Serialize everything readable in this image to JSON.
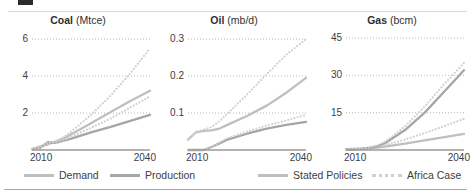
{
  "figure": {
    "legend": [
      {
        "key": "demand",
        "label": "Demand",
        "style": "solid",
        "color": "#bfbfbf"
      },
      {
        "key": "production",
        "label": "Production",
        "style": "solid",
        "color": "#a6a6a6"
      },
      {
        "key": "stated_policies",
        "label": "Stated Policies",
        "style": "solid",
        "color": "#bfbfbf"
      },
      {
        "key": "africa_case",
        "label": "Africa Case",
        "style": "dotted",
        "color": "#cfcfcf"
      }
    ]
  },
  "chart_data": [
    {
      "type": "line",
      "title": "Coal (Mtce)",
      "title_name": "Coal",
      "title_unit": "(Mtce)",
      "xlabel": "",
      "ylabel": "",
      "xlim": [
        2010,
        2040
      ],
      "ylim": [
        0,
        6.6
      ],
      "xticks": [
        2010,
        2040
      ],
      "xticklabels": [
        "2010",
        "2040"
      ],
      "yticks": [
        2,
        4,
        6
      ],
      "yticklabels": [
        "2",
        "4",
        "6"
      ],
      "grid": "horizontal-dotted",
      "x": [
        2010,
        2012,
        2014,
        2016,
        2018,
        2020,
        2025,
        2030,
        2035,
        2040
      ],
      "series": [
        {
          "name": "Demand Stated Policies",
          "style": "solid",
          "color": "#bfbfbf",
          "values": [
            0.05,
            0.18,
            0.3,
            0.45,
            0.62,
            0.85,
            1.45,
            2.05,
            2.65,
            3.2
          ]
        },
        {
          "name": "Demand Africa Case",
          "style": "dotted",
          "color": "#cfcfcf",
          "values": [
            0.05,
            0.18,
            0.3,
            0.48,
            0.7,
            1.0,
            1.9,
            2.95,
            4.15,
            5.5
          ]
        },
        {
          "name": "Production Stated Policies",
          "style": "solid",
          "color": "#a6a6a6",
          "values": [
            0.05,
            0.1,
            0.42,
            0.38,
            0.5,
            0.62,
            0.95,
            1.25,
            1.58,
            1.9
          ]
        },
        {
          "name": "Production Africa Case",
          "style": "dotted",
          "color": "#cfcfcf",
          "values": [
            0.05,
            0.1,
            0.42,
            0.4,
            0.55,
            0.72,
            1.2,
            1.7,
            2.3,
            2.9
          ]
        }
      ]
    },
    {
      "type": "line",
      "title": "Oil (mb/d)",
      "title_name": "Oil",
      "title_unit": "(mb/d)",
      "xlabel": "",
      "ylabel": "",
      "xlim": [
        2010,
        2040
      ],
      "ylim": [
        0,
        0.33
      ],
      "xticks": [
        2010,
        2040
      ],
      "xticklabels": [
        "2010",
        "2040"
      ],
      "yticks": [
        0.1,
        0.2,
        0.3
      ],
      "yticklabels": [
        "0.1",
        "0.2",
        "0.3"
      ],
      "grid": "horizontal-dotted",
      "x": [
        2010,
        2012,
        2014,
        2016,
        2018,
        2020,
        2025,
        2030,
        2035,
        2040
      ],
      "series": [
        {
          "name": "Demand Stated Policies",
          "style": "solid",
          "color": "#bfbfbf",
          "values": [
            0.028,
            0.048,
            0.052,
            0.053,
            0.058,
            0.068,
            0.092,
            0.12,
            0.155,
            0.195
          ]
        },
        {
          "name": "Demand Africa Case",
          "style": "dotted",
          "color": "#cfcfcf",
          "values": [
            0.028,
            0.048,
            0.055,
            0.062,
            0.078,
            0.098,
            0.15,
            0.205,
            0.258,
            0.3
          ]
        },
        {
          "name": "Production Stated Policies",
          "style": "solid",
          "color": "#a6a6a6",
          "values": [
            0.0,
            0.0,
            0.0,
            0.008,
            0.018,
            0.028,
            0.044,
            0.058,
            0.068,
            0.076
          ]
        },
        {
          "name": "Production Africa Case",
          "style": "dotted",
          "color": "#cfcfcf",
          "values": [
            0.0,
            0.0,
            0.0,
            0.008,
            0.02,
            0.032,
            0.05,
            0.066,
            0.08,
            0.095
          ]
        }
      ]
    },
    {
      "type": "line",
      "title": "Gas (bcm)",
      "title_name": "Gas",
      "title_unit": "(bcm)",
      "xlabel": "",
      "ylabel": "",
      "xlim": [
        2010,
        2040
      ],
      "ylim": [
        0,
        49
      ],
      "xticks": [
        2010,
        2040
      ],
      "xticklabels": [
        "2010",
        "2040"
      ],
      "yticks": [
        15,
        30,
        45
      ],
      "yticklabels": [
        "15",
        "30",
        "45"
      ],
      "grid": "horizontal-dotted",
      "x": [
        2010,
        2012,
        2014,
        2016,
        2018,
        2020,
        2025,
        2030,
        2035,
        2040
      ],
      "series": [
        {
          "name": "Demand Stated Policies",
          "style": "solid",
          "color": "#bfbfbf",
          "values": [
            0.3,
            0.4,
            0.5,
            0.7,
            1.0,
            1.4,
            2.6,
            3.9,
            5.2,
            6.5
          ]
        },
        {
          "name": "Demand Africa Case",
          "style": "dotted",
          "color": "#cfcfcf",
          "values": [
            0.3,
            0.4,
            0.5,
            0.8,
            1.3,
            2.0,
            4.2,
            6.8,
            9.6,
            12.5
          ]
        },
        {
          "name": "Production Stated Policies",
          "style": "solid",
          "color": "#a6a6a6",
          "values": [
            0.2,
            0.3,
            0.5,
            0.9,
            1.6,
            2.8,
            8.0,
            15.0,
            23.5,
            32.0
          ]
        },
        {
          "name": "Production Africa Case",
          "style": "dotted",
          "color": "#cfcfcf",
          "values": [
            0.2,
            0.3,
            0.5,
            1.0,
            1.9,
            3.4,
            9.5,
            17.5,
            26.5,
            35.0
          ]
        }
      ]
    }
  ]
}
